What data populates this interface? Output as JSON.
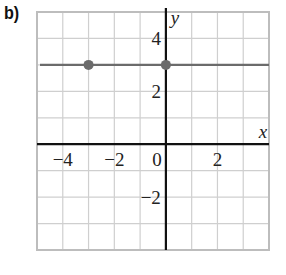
{
  "part_label": "b)",
  "chart_data": {
    "type": "line",
    "title": "",
    "xlabel": "x",
    "ylabel": "y",
    "xlim": [
      -5,
      4
    ],
    "ylim": [
      -4,
      5
    ],
    "grid": true,
    "x_tick_labels": [
      "−4",
      "−2",
      "0",
      "2"
    ],
    "x_tick_values": [
      -4,
      -2,
      0,
      2
    ],
    "y_tick_labels": [
      "4",
      "2",
      "−2"
    ],
    "y_tick_values": [
      4,
      2,
      -2
    ],
    "series": [
      {
        "name": "horizontal line y = 3",
        "equation": "y = 3",
        "x": [
          -5,
          4
        ],
        "y": [
          3,
          3
        ],
        "color": "#6b6b6b"
      }
    ],
    "points": [
      {
        "x": -3,
        "y": 3,
        "color": "#6b6b6b"
      },
      {
        "x": 0,
        "y": 3,
        "color": "#6b6b6b"
      }
    ],
    "colors": {
      "grid": "#cfcfcf",
      "border": "#bdbdbd",
      "axes": "#111111",
      "line": "#6b6b6b"
    }
  }
}
